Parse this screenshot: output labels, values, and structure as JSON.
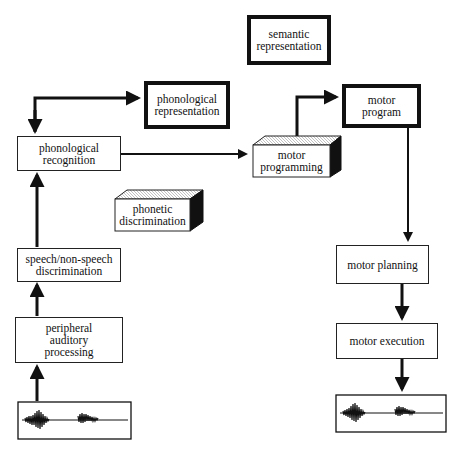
{
  "diagram": {
    "nodes": {
      "semantic_representation": "semantic\nrepresentation",
      "phonological_representation": "phonological\nrepresentation",
      "phonological_recognition": "phonological\nrecognition",
      "motor_programming": "motor\nprogramming",
      "motor_program": "motor\nprogram",
      "phonetic_discrimination": "phonetic\ndiscrimination",
      "speech_nonspeech_discrimination": "speech/non-speech\ndiscrimination",
      "peripheral_auditory_processing": "peripheral\nauditory\nprocessing",
      "motor_planning": "motor planning",
      "motor_execution": "motor execution"
    },
    "edges": [
      {
        "from": "speech_waveform_input",
        "to": "peripheral_auditory_processing"
      },
      {
        "from": "peripheral_auditory_processing",
        "to": "speech_nonspeech_discrimination"
      },
      {
        "from": "speech_nonspeech_discrimination",
        "to": "phonological_recognition"
      },
      {
        "from": "phonological_recognition",
        "to": "phonological_representation",
        "bidirectional": true
      },
      {
        "from": "phonological_recognition",
        "to": "motor_programming"
      },
      {
        "from": "motor_programming",
        "to": "motor_program"
      },
      {
        "from": "motor_program",
        "to": "motor_planning"
      },
      {
        "from": "motor_planning",
        "to": "motor_execution"
      },
      {
        "from": "motor_execution",
        "to": "speech_waveform_output"
      }
    ]
  }
}
